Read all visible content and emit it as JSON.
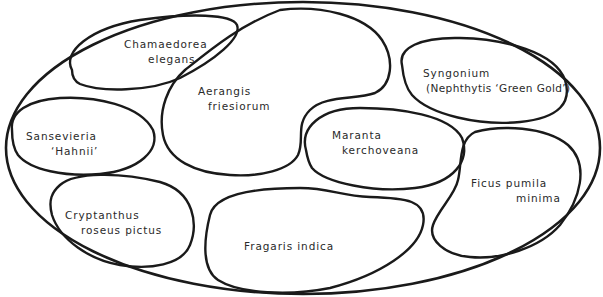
{
  "diagram": {
    "type": "planting-plan",
    "container": "oval-terrarium",
    "colors": {
      "stroke": "#1a1a1a",
      "text": "#2a2a2a",
      "background": "#ffffff"
    },
    "plants": [
      {
        "id": "chamaedorea",
        "line1": "Chamaedorea",
        "line2": "elegans"
      },
      {
        "id": "aerangis",
        "line1": "Aerangis",
        "line2": "friesiorum"
      },
      {
        "id": "syngonium",
        "line1": "Syngonium",
        "line2": "(Nephthytis ‘Green Gold’)"
      },
      {
        "id": "sansevieria",
        "line1": "Sansevieria",
        "line2": "‘Hahnii’"
      },
      {
        "id": "maranta",
        "line1": "Maranta",
        "line2": "kerchoveana"
      },
      {
        "id": "ficus",
        "line1": "Ficus pumila",
        "line2": "minima"
      },
      {
        "id": "cryptanthus",
        "line1": "Cryptanthus",
        "line2": "roseus pictus"
      },
      {
        "id": "fragaris",
        "line1": "Fragaris indica"
      }
    ]
  }
}
